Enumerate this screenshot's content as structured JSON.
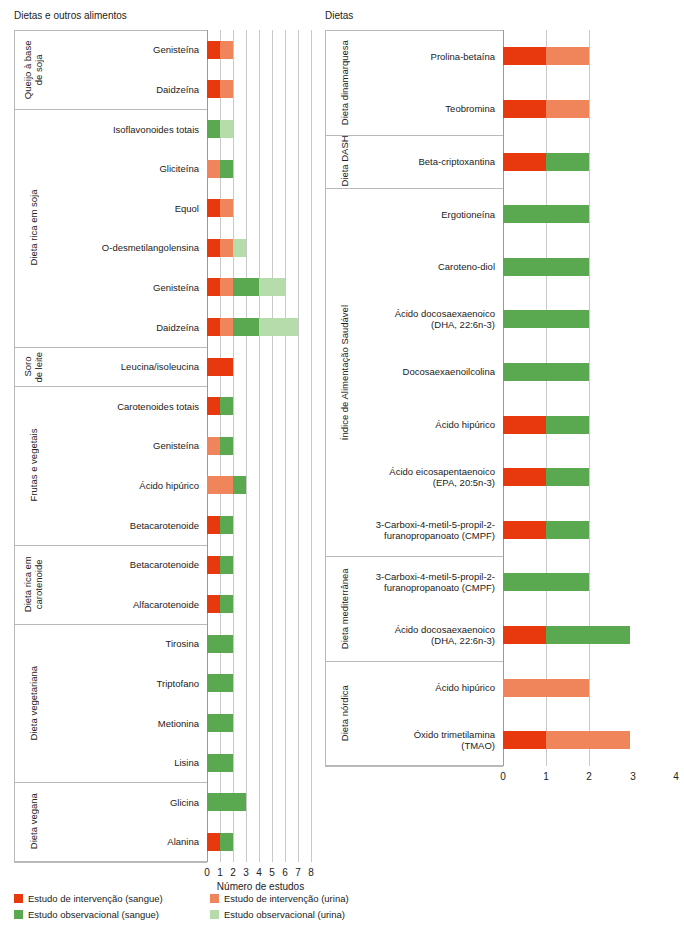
{
  "panels": {
    "left": {
      "title": "Dietas e outros alimentos"
    },
    "right": {
      "title": "Dietas"
    }
  },
  "axis": {
    "xlabel": "Número de estudos",
    "left_ticks": [
      "0",
      "1",
      "2",
      "3",
      "4",
      "5",
      "6",
      "7",
      "8"
    ],
    "right_ticks": [
      "0",
      "1",
      "2",
      "3",
      "4"
    ]
  },
  "legend": {
    "items": [
      {
        "label": "Estudo de intervenção (sangue)",
        "color": "#e8380d",
        "key": "int_blood"
      },
      {
        "label": "Estudo de intervenção (urina)",
        "color": "#f0845a",
        "key": "int_urine"
      },
      {
        "label": "Estudo observacional (sangue)",
        "color": "#5aa84f",
        "key": "obs_blood"
      },
      {
        "label": "Estudo observacional (urina)",
        "color": "#b6dcab",
        "key": "obs_urine"
      }
    ]
  },
  "colors": {
    "int_blood": "#e8380d",
    "int_urine": "#f0845a",
    "obs_blood": "#5aa84f",
    "obs_urine": "#b6dcab",
    "grid": "#c9c9c9",
    "frame": "#b9b9b9"
  },
  "chart_data": {
    "type": "bar",
    "orientation": "horizontal",
    "stacked": true,
    "title": "",
    "xlabel": "Número de estudos",
    "ylabel": "",
    "grid": true,
    "legend_position": "bottom-left",
    "series": [
      {
        "name": "Estudo de intervenção (sangue)",
        "key": "int_blood",
        "color": "#e8380d"
      },
      {
        "name": "Estudo de intervenção (urina)",
        "key": "int_urine",
        "color": "#f0845a"
      },
      {
        "name": "Estudo observacional (sangue)",
        "key": "obs_blood",
        "color": "#5aa84f"
      },
      {
        "name": "Estudo observacional (urina)",
        "key": "obs_urine",
        "color": "#b6dcab"
      }
    ],
    "panels": [
      {
        "id": "left",
        "title": "Dietas e outros alimentos",
        "xlim": [
          0,
          8
        ],
        "xticks": [
          0,
          1,
          2,
          3,
          4,
          5,
          6,
          7,
          8
        ],
        "groups": [
          {
            "label": "Queijo à base\nde soja",
            "rows": [
              {
                "label": "Genisteína",
                "int_blood": 1,
                "int_urine": 1,
                "obs_blood": 0,
                "obs_urine": 0
              },
              {
                "label": "Daidzeína",
                "int_blood": 1,
                "int_urine": 1,
                "obs_blood": 0,
                "obs_urine": 0
              }
            ]
          },
          {
            "label": "Dieta rica em soja",
            "rows": [
              {
                "label": "Isoflavonoides totais",
                "int_blood": 0,
                "int_urine": 0,
                "obs_blood": 1,
                "obs_urine": 1
              },
              {
                "label": "Gliciteína",
                "int_blood": 0,
                "int_urine": 1,
                "obs_blood": 1,
                "obs_urine": 0
              },
              {
                "label": "Equol",
                "int_blood": 1,
                "int_urine": 1,
                "obs_blood": 0,
                "obs_urine": 0
              },
              {
                "label": "O-desmetilangolensina",
                "int_blood": 1,
                "int_urine": 1,
                "obs_blood": 0,
                "obs_urine": 1
              },
              {
                "label": "Genisteína",
                "int_blood": 1,
                "int_urine": 1,
                "obs_blood": 2,
                "obs_urine": 2
              },
              {
                "label": "Daidzeína",
                "int_blood": 1,
                "int_urine": 1,
                "obs_blood": 2,
                "obs_urine": 3
              }
            ]
          },
          {
            "label": "Soro\nde leite",
            "rows": [
              {
                "label": "Leucina/isoleucina",
                "int_blood": 2,
                "int_urine": 0,
                "obs_blood": 0,
                "obs_urine": 0
              }
            ]
          },
          {
            "label": "Frutas e vegetais",
            "rows": [
              {
                "label": "Carotenoides totais",
                "int_blood": 1,
                "int_urine": 0,
                "obs_blood": 1,
                "obs_urine": 0
              },
              {
                "label": "Genisteína",
                "int_blood": 0,
                "int_urine": 1,
                "obs_blood": 1,
                "obs_urine": 0
              },
              {
                "label": "Ácido hipúrico",
                "int_blood": 0,
                "int_urine": 2,
                "obs_blood": 1,
                "obs_urine": 0
              },
              {
                "label": "Betacarotenoide",
                "int_blood": 1,
                "int_urine": 0,
                "obs_blood": 1,
                "obs_urine": 0
              }
            ]
          },
          {
            "label": "Dieta rica em\ncarotenoide",
            "rows": [
              {
                "label": "Betacarotenoide",
                "int_blood": 1,
                "int_urine": 0,
                "obs_blood": 1,
                "obs_urine": 0
              },
              {
                "label": "Alfacarotenoide",
                "int_blood": 1,
                "int_urine": 0,
                "obs_blood": 1,
                "obs_urine": 0
              }
            ]
          },
          {
            "label": "Dieta vegetariana",
            "rows": [
              {
                "label": "Tirosina",
                "int_blood": 0,
                "int_urine": 0,
                "obs_blood": 2,
                "obs_urine": 0
              },
              {
                "label": "Triptofano",
                "int_blood": 0,
                "int_urine": 0,
                "obs_blood": 2,
                "obs_urine": 0
              },
              {
                "label": "Metionina",
                "int_blood": 0,
                "int_urine": 0,
                "obs_blood": 2,
                "obs_urine": 0
              },
              {
                "label": "Lisina",
                "int_blood": 0,
                "int_urine": 0,
                "obs_blood": 2,
                "obs_urine": 0
              }
            ]
          },
          {
            "label": "Dieta vegana",
            "rows": [
              {
                "label": "Glicina",
                "int_blood": 0,
                "int_urine": 0,
                "obs_blood": 3,
                "obs_urine": 0
              },
              {
                "label": "Alanina",
                "int_blood": 1,
                "int_urine": 0,
                "obs_blood": 1,
                "obs_urine": 0
              }
            ]
          }
        ]
      },
      {
        "id": "right",
        "title": "Dietas",
        "xlim": [
          0,
          4
        ],
        "xticks": [
          0,
          1,
          2,
          3,
          4
        ],
        "groups": [
          {
            "label": "Dieta dinamarquesa",
            "rows": [
              {
                "label": "Prolina-betaína",
                "int_blood": 1,
                "int_urine": 1,
                "obs_blood": 0,
                "obs_urine": 0
              },
              {
                "label": "Teobromina",
                "int_blood": 1,
                "int_urine": 1,
                "obs_blood": 0,
                "obs_urine": 0
              }
            ]
          },
          {
            "label": "Dieta DASH",
            "rows": [
              {
                "label": "Beta-criptoxantina",
                "int_blood": 1,
                "int_urine": 0,
                "obs_blood": 1,
                "obs_urine": 0
              }
            ]
          },
          {
            "label": "Índice de Alimentação Saudável",
            "rows": [
              {
                "label": "Ergotioneína",
                "int_blood": 0,
                "int_urine": 0,
                "obs_blood": 2,
                "obs_urine": 0
              },
              {
                "label": "Caroteno-diol",
                "int_blood": 0,
                "int_urine": 0,
                "obs_blood": 2,
                "obs_urine": 0
              },
              {
                "label": "Ácido docosaexaenoico\n(DHA, 22:6n-3)",
                "int_blood": 0,
                "int_urine": 0,
                "obs_blood": 2,
                "obs_urine": 0
              },
              {
                "label": "Docosaexaenoilcolina",
                "int_blood": 0,
                "int_urine": 0,
                "obs_blood": 2,
                "obs_urine": 0
              },
              {
                "label": "Ácido hipúrico",
                "int_blood": 1,
                "int_urine": 0,
                "obs_blood": 1,
                "obs_urine": 0
              },
              {
                "label": "Ácido eicosapentaenoico\n(EPA, 20:5n-3)",
                "int_blood": 1,
                "int_urine": 0,
                "obs_blood": 1,
                "obs_urine": 0
              },
              {
                "label": "3-Carboxi-4-metil-5-propil-2-\nfuranopropanoato (CMPF)",
                "int_blood": 1,
                "int_urine": 0,
                "obs_blood": 1,
                "obs_urine": 0
              }
            ]
          },
          {
            "label": "Dieta mediterrânea",
            "rows": [
              {
                "label": "3-Carboxi-4-metil-5-propil-2-\nfuranopropanoato (CMPF)",
                "int_blood": 0,
                "int_urine": 0,
                "obs_blood": 2,
                "obs_urine": 0
              },
              {
                "label": "Ácido docosaexaenoico\n(DHA, 22:6n-3)",
                "int_blood": 1,
                "int_urine": 0,
                "obs_blood": 2,
                "obs_urine": 0
              }
            ]
          },
          {
            "label": "Dieta nórdica",
            "rows": [
              {
                "label": "Ácido hipúrico",
                "int_blood": 0,
                "int_urine": 2,
                "obs_blood": 0,
                "obs_urine": 0
              },
              {
                "label": "Óxido trimetilamina\n(TMAO)",
                "int_blood": 1,
                "int_urine": 2,
                "obs_blood": 0,
                "obs_urine": 0
              }
            ]
          }
        ]
      }
    ]
  }
}
